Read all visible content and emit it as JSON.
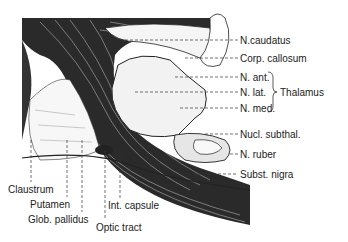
{
  "figure": {
    "type": "anatomical-section-illustration"
  },
  "labels_right": [
    {
      "id": "n-caudatus",
      "text": "N.caudatus",
      "x": 240,
      "y": 35,
      "lineFromX": 120,
      "lineY": 40
    },
    {
      "id": "corp-callosum",
      "text": "Corp. callosum",
      "x": 240,
      "y": 53,
      "lineFromX": 185,
      "lineY": 58
    },
    {
      "id": "n-ant",
      "text": "N. ant.",
      "x": 240,
      "y": 72,
      "lineFromX": 175,
      "lineY": 77
    },
    {
      "id": "n-lat",
      "text": "N. lat.",
      "x": 240,
      "y": 88,
      "lineFromX": 135,
      "lineY": 92
    },
    {
      "id": "n-med",
      "text": "N. med.",
      "x": 240,
      "y": 104,
      "lineFromX": 180,
      "lineY": 108
    },
    {
      "id": "nucl-subthal",
      "text": "Nucl. subthal.",
      "x": 240,
      "y": 129,
      "lineFromX": 205,
      "lineY": 134
    },
    {
      "id": "n-ruber",
      "text": "N. ruber",
      "x": 240,
      "y": 149,
      "lineFromX": 230,
      "lineY": 154
    },
    {
      "id": "subst-nigra",
      "text": "Subst. nigra",
      "x": 240,
      "y": 169,
      "lineFromX": 188,
      "lineY": 174
    }
  ],
  "thalamus_group": {
    "text": "Thalamus",
    "x": 276,
    "y": 88,
    "brace_top": 72,
    "brace_bottom": 112,
    "brace_x": 270
  },
  "labels_bottom": [
    {
      "id": "claustrum",
      "text": "Claustrum",
      "x": 8,
      "y": 184,
      "lineX": 31,
      "lineTop": 140,
      "lineBottom": 182
    },
    {
      "id": "putamen",
      "text": "Putamen",
      "x": 30,
      "y": 199,
      "lineX": 67,
      "lineTop": 140,
      "lineBottom": 197
    },
    {
      "id": "glob-pallidus",
      "text": "Glob. pallidus",
      "x": 28,
      "y": 214,
      "lineX": 82,
      "lineTop": 140,
      "lineBottom": 212
    },
    {
      "id": "int-capsule",
      "text": "Int. capsule",
      "x": 108,
      "y": 200,
      "lineX": 120,
      "lineTop": 150,
      "lineBottom": 198
    },
    {
      "id": "optic-tract",
      "text": "Optic tract",
      "x": 96,
      "y": 222,
      "lineX": 105,
      "lineTop": 150,
      "lineBottom": 220
    }
  ],
  "colors": {
    "ink": "#1a1a1a",
    "paper": "#ffffff",
    "stipple": "#d8d8d8"
  }
}
